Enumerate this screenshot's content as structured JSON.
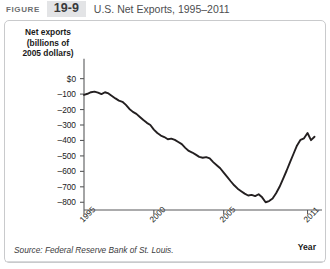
{
  "figure": {
    "label": "FIGURE",
    "number": "19-9",
    "title": "U.S. Net Exports, 1995–2011"
  },
  "source": {
    "text": "Source: Federal Reserve Bank of St. Louis."
  },
  "axis": {
    "y_title_line1": "Net exports",
    "y_title_line2": "(billions of",
    "y_title_line3": "2005 dollars)",
    "x_title": "Year",
    "y_ticks": [
      "$0",
      "–100",
      "–200",
      "–300",
      "–400",
      "–500",
      "–600",
      "–700",
      "–800"
    ],
    "x_ticks": [
      "1995",
      "2000",
      "2005",
      "2011"
    ]
  },
  "colors": {
    "line": "#231f20",
    "axis": "#58595b",
    "badge_bg": "#e3e4e6",
    "card_border": "#c9cacc",
    "title_text": "#4d4e50"
  },
  "chart_data": {
    "type": "line",
    "title": "U.S. Net Exports, 1995–2011",
    "xlabel": "Year",
    "ylabel": "Net exports (billions of 2005 dollars)",
    "xlim": [
      1995,
      2011.75
    ],
    "ylim": [
      -850,
      30
    ],
    "ytick_values": [
      0,
      -100,
      -200,
      -300,
      -400,
      -500,
      -600,
      -700,
      -800
    ],
    "xtick_values": [
      1995,
      2000,
      2005,
      2011
    ],
    "grid": false,
    "legend": null,
    "series": [
      {
        "name": "U.S. Net Exports",
        "x": [
          1995.0,
          1995.25,
          1995.5,
          1995.75,
          1996.0,
          1996.25,
          1996.5,
          1996.75,
          1997.0,
          1997.25,
          1997.5,
          1997.75,
          1998.0,
          1998.25,
          1998.5,
          1998.75,
          1999.0,
          1999.25,
          1999.5,
          1999.75,
          2000.0,
          2000.25,
          2000.5,
          2000.75,
          2001.0,
          2001.25,
          2001.5,
          2001.75,
          2002.0,
          2002.25,
          2002.5,
          2002.75,
          2003.0,
          2003.25,
          2003.5,
          2003.75,
          2004.0,
          2004.25,
          2004.5,
          2004.75,
          2005.0,
          2005.25,
          2005.5,
          2005.75,
          2006.0,
          2006.25,
          2006.5,
          2006.75,
          2007.0,
          2007.25,
          2007.5,
          2007.75,
          2008.0,
          2008.25,
          2008.5,
          2008.75,
          2009.0,
          2009.25,
          2009.5,
          2009.75,
          2010.0,
          2010.25,
          2010.5,
          2010.75,
          2011.0,
          2011.25,
          2011.5
        ],
        "y": [
          -105,
          -98,
          -88,
          -84,
          -90,
          -100,
          -88,
          -96,
          -112,
          -128,
          -142,
          -150,
          -170,
          -196,
          -215,
          -228,
          -248,
          -268,
          -286,
          -300,
          -330,
          -352,
          -368,
          -378,
          -392,
          -388,
          -396,
          -410,
          -424,
          -448,
          -468,
          -478,
          -492,
          -506,
          -512,
          -508,
          -516,
          -540,
          -560,
          -580,
          -608,
          -636,
          -664,
          -690,
          -712,
          -728,
          -744,
          -756,
          -752,
          -760,
          -748,
          -768,
          -800,
          -792,
          -776,
          -742,
          -700,
          -648,
          -596,
          -540,
          -486,
          -432,
          -396,
          -386,
          -352,
          -398,
          -376
        ]
      }
    ]
  }
}
